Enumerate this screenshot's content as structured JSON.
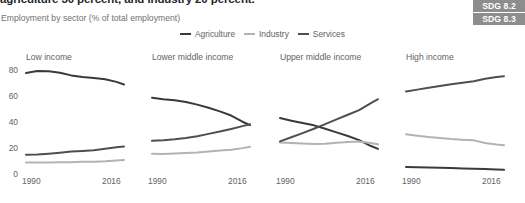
{
  "header": {
    "title": "agriculture 30 percent, and industry 20 percent.",
    "subtitle": "Employment by sector (% of total employment)"
  },
  "badges": [
    {
      "label": "SDG 8.2"
    },
    {
      "label": "SDG 8.3"
    }
  ],
  "colors": {
    "agriculture": "#3a3a3a",
    "industry": "#b3b3b3",
    "services": "#4f4f4f",
    "text": "#5e6367",
    "title": "#23272b",
    "badge_bg": "#8d8d8d"
  },
  "legend": [
    {
      "label": "Agriculture",
      "color": "#3a3a3a"
    },
    {
      "label": "Industry",
      "color": "#b3b3b3"
    },
    {
      "label": "Services",
      "color": "#4f4f4f"
    }
  ],
  "axis": {
    "yticks": [
      "80",
      "60",
      "40",
      "20",
      "0"
    ],
    "ylim": [
      0,
      85
    ],
    "xstart": "1990",
    "xend": "2016",
    "grid": false
  },
  "chart_data": {
    "type": "line",
    "title": "Employment by sector (% of total employment)",
    "xlabel": "",
    "ylabel": "% of total employment",
    "ylim": [
      0,
      85
    ],
    "yticks": [
      0,
      20,
      40,
      60,
      80
    ],
    "x": [
      1990,
      1993,
      1996,
      1999,
      2002,
      2005,
      2008,
      2011,
      2014,
      2016
    ],
    "legend_position": "top-center",
    "panels": [
      {
        "name": "Low income",
        "series": [
          {
            "name": "Agriculture",
            "color": "#3a3a3a",
            "values": [
              78.0,
              79.6,
              79.4,
              78.2,
              76.2,
              75.0,
              74.2,
              73.2,
              71.2,
              69.2
            ]
          },
          {
            "name": "Industry",
            "color": "#b3b3b3",
            "values": [
              8.8,
              8.9,
              8.8,
              9.0,
              9.1,
              9.4,
              9.5,
              9.9,
              10.5,
              10.9
            ]
          },
          {
            "name": "Services",
            "color": "#4f4f4f",
            "values": [
              14.8,
              15.0,
              15.6,
              16.4,
              17.3,
              17.8,
              18.3,
              19.6,
              20.6,
              21.2
            ]
          }
        ]
      },
      {
        "name": "Lower middle income",
        "series": [
          {
            "name": "Agriculture",
            "color": "#3a3a3a",
            "values": [
              59.0,
              57.8,
              57.0,
              55.6,
              53.6,
              51.2,
              48.4,
              45.2,
              40.4,
              37.8
            ]
          },
          {
            "name": "Industry",
            "color": "#b3b3b3",
            "values": [
              15.6,
              15.4,
              15.8,
              16.2,
              16.6,
              17.3,
              18.1,
              18.8,
              20.0,
              21.0
            ]
          },
          {
            "name": "Services",
            "color": "#4f4f4f",
            "values": [
              25.6,
              26.0,
              26.8,
              27.8,
              29.2,
              31.0,
              32.8,
              34.8,
              37.0,
              38.4
            ]
          }
        ]
      },
      {
        "name": "Upper middle income",
        "series": [
          {
            "name": "Agriculture",
            "color": "#3a3a3a",
            "values": [
              43.2,
              41.2,
              39.4,
              37.6,
              35.0,
              32.2,
              29.4,
              26.2,
              21.8,
              19.4
            ]
          },
          {
            "name": "Industry",
            "color": "#b3b3b3",
            "values": [
              24.4,
              24.0,
              23.6,
              23.2,
              23.4,
              24.2,
              24.8,
              25.2,
              24.0,
              23.0
            ]
          },
          {
            "name": "Services",
            "color": "#4f4f4f",
            "values": [
              25.2,
              28.4,
              31.6,
              35.0,
              38.6,
              42.2,
              45.8,
              49.4,
              54.6,
              57.8
            ]
          }
        ]
      },
      {
        "name": "High income",
        "series": [
          {
            "name": "Agriculture",
            "color": "#3a3a3a",
            "values": [
              5.4,
              5.2,
              5.0,
              4.8,
              4.6,
              4.3,
              4.0,
              3.8,
              3.4,
              3.2
            ]
          },
          {
            "name": "Industry",
            "color": "#b3b3b3",
            "values": [
              30.8,
              29.6,
              28.6,
              27.8,
              27.0,
              26.4,
              26.0,
              24.0,
              22.8,
              22.2
            ]
          },
          {
            "name": "Services",
            "color": "#4f4f4f",
            "values": [
              63.8,
              65.2,
              66.6,
              68.0,
              69.4,
              70.6,
              71.6,
              73.6,
              75.0,
              75.6
            ]
          }
        ]
      }
    ]
  }
}
